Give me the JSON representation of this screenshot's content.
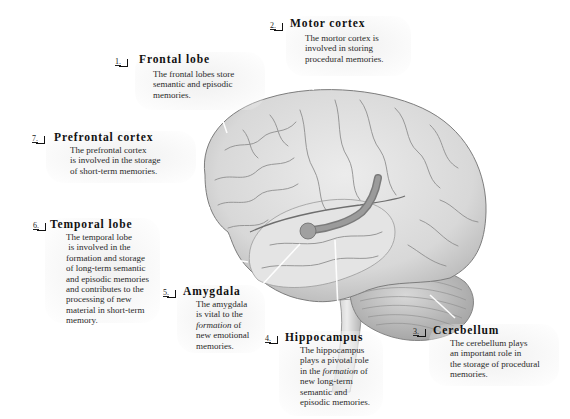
{
  "figure": {
    "type": "anatomical-diagram",
    "colors": {
      "background": "#ffffff",
      "brain_fill": "#dedede",
      "brain_shadow": "#b9b9b9",
      "gyri_line": "#8e8e8e",
      "hippocampus": "#8a8a8a",
      "text": "#1a1a1a"
    }
  },
  "callouts": [
    {
      "number": "1.",
      "title": "Frontal lobe",
      "lines": [
        "The frontal lobes store",
        "semantic and episodic",
        "memories."
      ]
    },
    {
      "number": "2.",
      "title": "Motor cortex",
      "lines": [
        "The mortor cortex is",
        "involved in storing",
        "procedural memories."
      ]
    },
    {
      "number": "3.",
      "title": "Cerebellum",
      "lines": [
        "The cerebellum plays",
        "an important role in",
        "the storage of procedural",
        "memories."
      ]
    },
    {
      "number": "4.",
      "title": "Hippocampus",
      "lines": [
        "The hippocampus",
        "plays a pivotal role",
        "in the formation of",
        "new long-term",
        "semantic and",
        "episodic memories."
      ]
    },
    {
      "number": "5.",
      "title": "Amygdala",
      "lines": [
        "The amygdala",
        "is vital to the",
        "formation of",
        "new emotional",
        "memories."
      ]
    },
    {
      "number": "6.",
      "title": "Temporal lobe",
      "lines": [
        "The temporal lobe",
        " is involved in the",
        "formation and storage",
        "of long-term semantic",
        "and episodic memories",
        "and contributes to the",
        "processing of new",
        "material in short-term",
        "memory."
      ]
    },
    {
      "number": "7.",
      "title": "Prefrontal cortex",
      "lines": [
        "The prefrontal cortex",
        "is involved in the storage",
        "of short-term memories."
      ]
    }
  ]
}
